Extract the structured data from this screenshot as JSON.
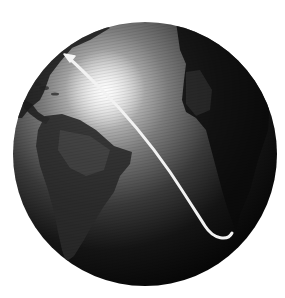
{
  "image": {
    "subject": "Earth globe with migration route arrow",
    "background_color": "#ffffff",
    "globe": {
      "center": [
        145,
        154
      ],
      "radius": 132,
      "shading": "monochrome with specular highlight upper-left",
      "highlight_center": [
        105,
        90
      ],
      "visible_landmasses": [
        "North America (east coast)",
        "Central America",
        "Caribbean",
        "South America",
        "Africa (west)",
        "Europe (edge)"
      ]
    },
    "arrow": {
      "color": "#f2f2f2",
      "path_points": [
        [
          232,
          234
        ],
        [
          222,
          240
        ],
        [
          205,
          225
        ],
        [
          190,
          205
        ],
        [
          160,
          160
        ],
        [
          130,
          120
        ],
        [
          95,
          85
        ],
        [
          68,
          58
        ]
      ],
      "head_at": [
        66,
        56
      ],
      "direction": "from South Atlantic toward North America (northwest)"
    }
  }
}
